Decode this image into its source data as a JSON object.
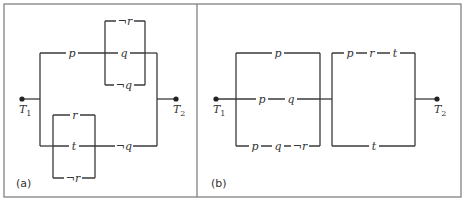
{
  "panels": [
    {
      "caption": "(a)",
      "terminals": {
        "left": "T",
        "left_sub": "1",
        "right": "T",
        "right_sub": "2"
      },
      "labels": {
        "upper_series": "p",
        "upper_bracket_top": "¬r",
        "upper_bracket_mid": "q",
        "upper_bracket_bottom": "¬q",
        "lower_bracket_top": "r",
        "lower_bracket_mid": "t",
        "lower_bracket_bottom": "¬r",
        "lower_series": "¬q"
      }
    },
    {
      "caption": "(b)",
      "terminals": {
        "left": "T",
        "left_sub": "1",
        "right": "T",
        "right_sub": "2"
      },
      "labels": {
        "box1_top": "p",
        "box1_mid_1": "p",
        "box1_mid_2": "q",
        "box1_bottom_1": "p",
        "box1_bottom_2": "q",
        "box1_bottom_3": "¬r",
        "box2_top_1": "p",
        "box2_top_2": "r",
        "box2_top_3": "t",
        "box2_bottom": "t"
      }
    }
  ]
}
